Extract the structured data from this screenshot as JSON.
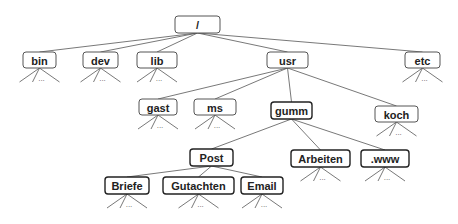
{
  "diagram": {
    "nodes": [
      {
        "id": "root",
        "label": "/"
      },
      {
        "id": "bin",
        "label": "bin",
        "parent": "root",
        "collapsed": true
      },
      {
        "id": "dev",
        "label": "dev",
        "parent": "root",
        "collapsed": true
      },
      {
        "id": "lib",
        "label": "lib",
        "parent": "root",
        "collapsed": true
      },
      {
        "id": "usr",
        "label": "usr",
        "parent": "root"
      },
      {
        "id": "etc",
        "label": "etc",
        "parent": "root",
        "collapsed": true
      },
      {
        "id": "gast",
        "label": "gast",
        "parent": "usr",
        "collapsed": true
      },
      {
        "id": "ms",
        "label": "ms",
        "parent": "usr",
        "collapsed": true
      },
      {
        "id": "gumm",
        "label": "gumm",
        "parent": "usr",
        "highlighted": true
      },
      {
        "id": "koch",
        "label": "koch",
        "parent": "usr",
        "collapsed": true
      },
      {
        "id": "post",
        "label": "Post",
        "parent": "gumm",
        "highlighted": true
      },
      {
        "id": "arbeiten",
        "label": "Arbeiten",
        "parent": "gumm",
        "highlighted": true,
        "collapsed": true
      },
      {
        "id": "www",
        "label": ".www",
        "parent": "gumm",
        "highlighted": true,
        "collapsed": true
      },
      {
        "id": "briefe",
        "label": "Briefe",
        "parent": "post",
        "highlighted": true,
        "collapsed": true
      },
      {
        "id": "gutachten",
        "label": "Gutachten",
        "parent": "post",
        "highlighted": true,
        "collapsed": true
      },
      {
        "id": "email",
        "label": "Email",
        "parent": "post",
        "highlighted": true,
        "collapsed": true
      }
    ],
    "ellipsis": "..."
  }
}
